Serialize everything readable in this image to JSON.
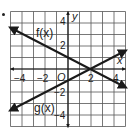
{
  "chart_data": {
    "type": "line",
    "title": "",
    "xlabel": "x",
    "ylabel": "y",
    "xlim": [
      -5,
      5
    ],
    "ylim": [
      -5,
      5
    ],
    "grid": true,
    "origin_label": "O",
    "x_ticks": [
      {
        "value": -4,
        "label": "−4"
      },
      {
        "value": -2,
        "label": "−2"
      },
      {
        "value": 2,
        "label": "2"
      },
      {
        "value": 4,
        "label": "4"
      }
    ],
    "y_ticks": [
      {
        "value": 4,
        "label": "4"
      },
      {
        "value": 2,
        "label": "2"
      },
      {
        "value": -2,
        "label": "−2"
      },
      {
        "value": -4,
        "label": "−4"
      }
    ],
    "series": [
      {
        "name": "f(x)",
        "equation": "y = -0.5x + 1",
        "x": [
          -5,
          5
        ],
        "y": [
          3.5,
          -1.5
        ],
        "color": "#1a1a1a"
      },
      {
        "name": "g(x)",
        "equation": "y = 0.5x - 1",
        "x": [
          -5,
          5
        ],
        "y": [
          -3.5,
          1.5
        ],
        "color": "#1a1a1a"
      }
    ],
    "intersection": {
      "x": 2,
      "y": 0
    },
    "legend": "inline labels"
  },
  "labels": {
    "f": "f(x)",
    "g": "g(x)",
    "x_axis": "x",
    "y_axis": "y",
    "origin": "O",
    "xt_m4": "−4",
    "xt_m2": "−2",
    "xt_2": "2",
    "xt_4": "4",
    "yt_4": "4",
    "yt_2": "2",
    "yt_m2": "−2",
    "yt_m4": "−4"
  }
}
